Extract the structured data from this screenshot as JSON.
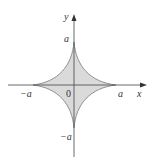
{
  "diagram": {
    "title": "",
    "curve": "astroid x^(2/3) + y^(2/3) = a^(2/3)",
    "fill_color": "#d9d9d9",
    "stroke_color": "#777777",
    "axis_color": "#444444",
    "labels": {
      "y_axis": "y",
      "x_axis": "x",
      "top": "a",
      "right": "a",
      "left": "−a",
      "bottom": "−a",
      "origin": "0"
    }
  }
}
